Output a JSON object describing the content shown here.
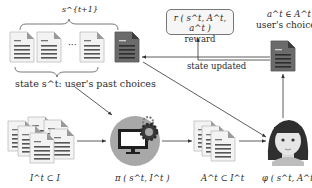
{
  "diagram": {
    "state_bracket_label": "s^{t+1}",
    "state_caption": "state s^t: user's past choices",
    "ellipsis": "···",
    "reward": {
      "formula": "r ( s^t, A^t, a^t )",
      "label": "reward"
    },
    "user_choice": {
      "formula": "a^t ∈ A^t",
      "label": "user's choice"
    },
    "state_updated_label": "state updated",
    "candidates_label": "I^t ⊂ I",
    "policy_label": "π ( s^t, I^t )",
    "recommended_label": "A^t ⊂ I^t",
    "user_model_label": "φ ( s^t, A^t )",
    "nodes": [
      {
        "id": "past-choices",
        "kind": "document-sequence"
      },
      {
        "id": "new-choice",
        "kind": "document-dark"
      },
      {
        "id": "reward",
        "kind": "rounded-box"
      },
      {
        "id": "user-choice",
        "kind": "document-dark"
      },
      {
        "id": "candidate-items",
        "kind": "document-stack"
      },
      {
        "id": "policy",
        "kind": "computer-gear-icon"
      },
      {
        "id": "recommended-set",
        "kind": "document-stack"
      },
      {
        "id": "user",
        "kind": "avatar"
      }
    ],
    "edges": [
      {
        "from": "user-choice",
        "to": "reward"
      },
      {
        "from": "user-choice",
        "to": "new-choice",
        "label": "state updated"
      },
      {
        "from": "past-choices",
        "to": "policy"
      },
      {
        "from": "candidate-items",
        "to": "policy"
      },
      {
        "from": "policy",
        "to": "recommended-set"
      },
      {
        "from": "recommended-set",
        "to": "user"
      },
      {
        "from": "past-choices",
        "to": "user"
      },
      {
        "from": "user",
        "to": "user-choice"
      }
    ],
    "colors": {
      "doc_light": "#f2f2f2",
      "doc_lines": "#4d4d4d",
      "doc_dark": "#6d6d6d",
      "policy_circle": "#a9a9a9",
      "arrow": "#333333"
    }
  }
}
